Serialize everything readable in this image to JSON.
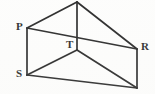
{
  "figure": {
    "background_color": "#fdfdfc",
    "stroke_color": "#1a1a1a",
    "label_color": "#1a1a1a",
    "width": 155,
    "height": 94,
    "vertices": [
      {
        "id": "apex",
        "label": "",
        "label_visible": false,
        "x": 77,
        "y": 2,
        "note": "top apex, cut off by image edge"
      },
      {
        "id": "P",
        "label": "P",
        "label_visible": true,
        "x": 27,
        "y": 28,
        "label_x": 16,
        "label_y": 21
      },
      {
        "id": "T",
        "label": "T",
        "label_visible": true,
        "x": 77,
        "y": 50,
        "label_x": 66,
        "label_y": 39
      },
      {
        "id": "R",
        "label": "R",
        "label_visible": true,
        "x": 137,
        "y": 49,
        "label_x": 141,
        "label_y": 41
      },
      {
        "id": "S",
        "label": "S",
        "label_visible": true,
        "x": 27,
        "y": 75,
        "label_x": 16,
        "label_y": 68
      },
      {
        "id": "B",
        "label": "",
        "label_visible": false,
        "x": 137,
        "y": 88,
        "note": "bottom-right vertex, label cut off at image edge"
      }
    ],
    "edges": [
      {
        "id": "apex-P",
        "from": "apex",
        "to": "P"
      },
      {
        "id": "apex-R",
        "from": "apex",
        "to": "R"
      },
      {
        "id": "apex-T",
        "from": "apex",
        "to": "T"
      },
      {
        "id": "P-R",
        "from": "P",
        "to": "R"
      },
      {
        "id": "P-S",
        "from": "P",
        "to": "S"
      },
      {
        "id": "T-S",
        "from": "T",
        "to": "S"
      },
      {
        "id": "T-B",
        "from": "T",
        "to": "B"
      },
      {
        "id": "S-B",
        "from": "S",
        "to": "B"
      },
      {
        "id": "R-B",
        "from": "R",
        "to": "B"
      }
    ]
  }
}
